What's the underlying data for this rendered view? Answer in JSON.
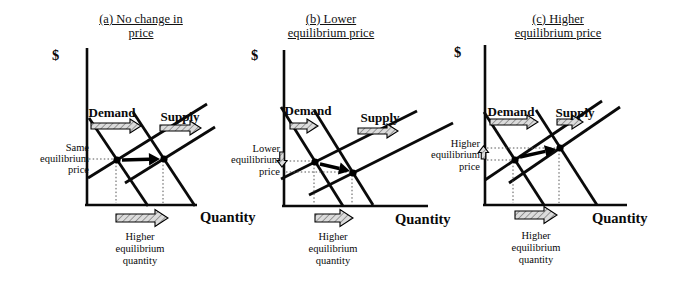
{
  "figure": {
    "background": "#ffffff",
    "ink_color": "#0a0a0a",
    "hatch_fill": "#dcdcdc",
    "hatch_line_color": "#808080",
    "panels": [
      {
        "id": "a",
        "title_lines": [
          "(a) No change in",
          "price"
        ],
        "dollar_label": "$",
        "quantity_axis_label": "Quantity",
        "demand_label": "Demand",
        "supply_label": "Supply",
        "price_note_lines": [
          "Same",
          "equilibrium",
          "price"
        ],
        "price_arrow": "none",
        "quantity_note_lines": [
          "Higher",
          "equilibrium",
          "quantity"
        ],
        "shifts": {
          "demand": "right",
          "supply": "right",
          "price": "unchanged",
          "quantity": "higher"
        },
        "geometry": {
          "offset_x": 0,
          "title_center_x": 141,
          "axis": {
            "x": 87,
            "top": 48,
            "bottom": 205,
            "right": 197
          },
          "demand1": [
            89,
            118,
            148,
            206
          ],
          "demand2": [
            133,
            112,
            195,
            206
          ],
          "supply1": [
            88,
            178,
            207,
            104
          ],
          "supply2": [
            125,
            183,
            215,
            127
          ],
          "eq1": [
            117,
            160
          ],
          "eq2": [
            164,
            159
          ],
          "dotted": [
            [
              89,
              159,
              114,
              159
            ],
            [
              116,
              162,
              116,
              203
            ],
            [
              163,
              161,
              163,
              203
            ]
          ],
          "shift_arrow": [
            122,
            160,
            160,
            159
          ],
          "demand_text": [
            112,
            117
          ],
          "demand_arrow": [
            91,
            126,
            50
          ],
          "supply_text": [
            180,
            121
          ],
          "supply_arrow": [
            160,
            128,
            41
          ],
          "price_note": {
            "x": 89,
            "ys": [
              151,
              162,
              173
            ]
          },
          "price_arrow_pos": null,
          "qty_arrow": [
            116,
            218,
            52
          ],
          "qty_note": {
            "x": 140,
            "ys": [
              240,
              252,
              264
            ]
          },
          "quantity_text": [
            200,
            222
          ],
          "dollar_text": [
            52,
            60
          ]
        }
      },
      {
        "id": "b",
        "title_lines": [
          "(b) Lower",
          "equilibrium price"
        ],
        "dollar_label": "$",
        "quantity_axis_label": "Quantity",
        "demand_label": "Demand",
        "supply_label": "Supply",
        "price_note_lines": [
          "Lower",
          "equilibrium",
          "price"
        ],
        "price_arrow": "down",
        "quantity_note_lines": [
          "Higher",
          "equilibrium",
          "quantity"
        ],
        "shifts": {
          "demand": "right",
          "supply": "right",
          "price": "lower",
          "quantity": "higher"
        },
        "geometry": {
          "offset_x": 225,
          "title_center_x": 106,
          "axis": {
            "x": 59,
            "top": 50,
            "bottom": 206,
            "right": 203
          },
          "demand1": [
            56,
            107,
            118,
            206
          ],
          "demand2": [
            89,
            110,
            148,
            205
          ],
          "supply1": [
            56,
            179,
            192,
            111
          ],
          "supply2": [
            84,
            195,
            228,
            123
          ],
          "eq1": [
            90,
            162
          ],
          "eq2": [
            128,
            173
          ],
          "dotted": [
            [
              61,
              161,
              87,
              161
            ],
            [
              61,
              172,
              125,
              172
            ],
            [
              89,
              164,
              89,
              204
            ],
            [
              127,
              175,
              127,
              204
            ]
          ],
          "shift_arrow": [
            95,
            164,
            125,
            171
          ],
          "demand_text": [
            83,
            115
          ],
          "demand_arrow": [
            65,
            126,
            28
          ],
          "supply_text": [
            155,
            122
          ],
          "supply_arrow": [
            133,
            131,
            40
          ],
          "price_note": {
            "x": 55,
            "ys": [
              152,
              163,
              175
            ]
          },
          "price_arrow_pos": {
            "cx": 57,
            "y1": 152,
            "y2": 167
          },
          "qty_arrow": [
            90,
            218,
            38
          ],
          "qty_note": {
            "x": 108,
            "ys": [
              240,
              252,
              264
            ]
          },
          "quantity_text": [
            170,
            224
          ],
          "dollar_text": [
            26,
            60
          ]
        }
      },
      {
        "id": "c",
        "title_lines": [
          "(c) Higher",
          "equilibrium price"
        ],
        "dollar_label": "$",
        "quantity_axis_label": "Quantity",
        "demand_label": "Demand",
        "supply_label": "Supply",
        "price_note_lines": [
          "Higher",
          "equilibrium",
          "price"
        ],
        "price_arrow": "up",
        "quantity_note_lines": [
          "Higher",
          "equilibrium",
          "quantity"
        ],
        "shifts": {
          "demand": "right",
          "supply": "right",
          "price": "higher",
          "quantity": "higher"
        },
        "geometry": {
          "offset_x": 450,
          "title_center_x": 108,
          "axis": {
            "x": 35,
            "top": 45,
            "bottom": 205,
            "right": 177
          },
          "demand1": [
            34,
            112,
            94,
            205
          ],
          "demand2": [
            86,
            110,
            147,
            205
          ],
          "supply1": [
            35,
            180,
            152,
            101
          ],
          "supply2": [
            59,
            183,
            170,
            107
          ],
          "eq1": [
            65,
            160
          ],
          "eq2": [
            110,
            148
          ],
          "dotted": [
            [
              37,
              148,
              107,
              148
            ],
            [
              37,
              160,
              62,
              160
            ],
            [
              63,
              162,
              63,
              203
            ],
            [
              109,
              150,
              109,
              203
            ]
          ],
          "shift_arrow": [
            70,
            157,
            106,
            149
          ],
          "demand_text": [
            61,
            116
          ],
          "demand_arrow": [
            40,
            122,
            48
          ],
          "supply_text": [
            125,
            117
          ],
          "supply_arrow": [
            107,
            122,
            26
          ],
          "price_note": {
            "x": 30,
            "ys": [
              147,
              158,
              170
            ]
          },
          "price_arrow_pos": {
            "cx": 33.5,
            "y1": 159,
            "y2": 146
          },
          "qty_arrow": [
            65,
            215,
            42
          ],
          "qty_note": {
            "x": 86,
            "ys": [
              239,
              251,
              263
            ]
          },
          "quantity_text": [
            142,
            223
          ],
          "dollar_text": [
            4,
            57
          ]
        }
      }
    ]
  }
}
